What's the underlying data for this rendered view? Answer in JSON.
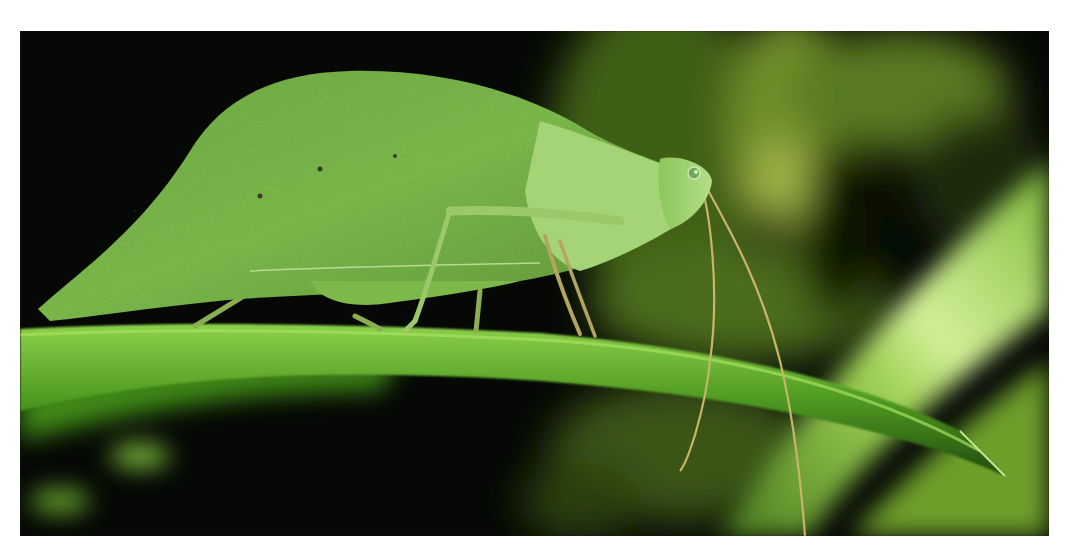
{
  "photo": {
    "alt": "Green leaf-mimic katydid perched on a grass blade at night",
    "subject": "katydid",
    "scene": {
      "background": "dark, out-of-focus green foliage",
      "perch": "narrow green grass blade running diagonally left to right",
      "foreground_right": "large blurred bright green blade sweeping diagonally up-right"
    },
    "colors": {
      "background_dark": "#050805",
      "foliage_mid": "#3d5a1a",
      "foliage_light": "#8fb24a",
      "blade_bright": "#b6dc6a",
      "insect_body": "#6fae3c",
      "insect_highlight": "#a9d77a",
      "antenna": "#c8b56a",
      "frame_border": "#ffffff"
    }
  }
}
